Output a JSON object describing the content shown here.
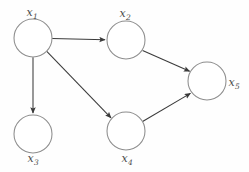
{
  "diagram": {
    "type": "directed-graph",
    "width": 249,
    "height": 172,
    "background_color": "#fefefe",
    "node_stroke_color": "#8d8d8d",
    "node_fill_color": "#ffffff",
    "edge_color": "#3a3a3a",
    "label_color": "#4a4a4a",
    "node_radius": 19,
    "nodes": [
      {
        "id": "x1",
        "label_base": "x",
        "label_sub": "1",
        "label_text": "x1",
        "cx": 33,
        "cy": 38,
        "label_x": 32,
        "label_y": 12,
        "label_position": "above"
      },
      {
        "id": "x2",
        "label_base": "x",
        "label_sub": "2",
        "label_text": "x2",
        "cx": 126,
        "cy": 40,
        "label_x": 125,
        "label_y": 13,
        "label_position": "above"
      },
      {
        "id": "x3",
        "label_base": "x",
        "label_sub": "3",
        "label_text": "x3",
        "cx": 33,
        "cy": 134,
        "label_x": 33,
        "label_y": 158,
        "label_position": "below"
      },
      {
        "id": "x4",
        "label_base": "x",
        "label_sub": "4",
        "label_text": "x4",
        "cx": 126,
        "cy": 131,
        "label_x": 127,
        "label_y": 158,
        "label_position": "below"
      },
      {
        "id": "x5",
        "label_base": "x",
        "label_sub": "5",
        "label_text": "x5",
        "cx": 207,
        "cy": 81,
        "label_x": 234,
        "label_y": 82,
        "label_position": "right"
      }
    ],
    "edges": [
      {
        "id": "e-x1-x2",
        "from": "x1",
        "to": "x2",
        "direction": "right"
      },
      {
        "id": "e-x1-x3",
        "from": "x1",
        "to": "x3",
        "direction": "down"
      },
      {
        "id": "e-x1-x4",
        "from": "x1",
        "to": "x4",
        "direction": "down-right"
      },
      {
        "id": "e-x2-x5",
        "from": "x2",
        "to": "x5",
        "direction": "down-right"
      },
      {
        "id": "e-x4-x5",
        "from": "x4",
        "to": "x5",
        "direction": "up-right"
      }
    ]
  }
}
